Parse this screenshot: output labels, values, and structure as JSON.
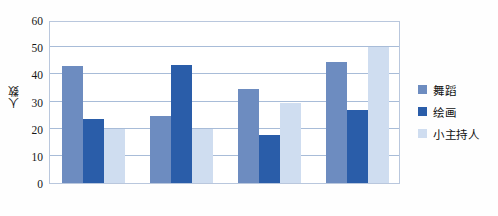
{
  "chart_data": {
    "type": "bar",
    "title": "",
    "xlabel": "",
    "ylabel": "人数",
    "ylim": [
      0,
      60
    ],
    "ytick_values": [
      0,
      10,
      20,
      30,
      40,
      50,
      60
    ],
    "ytick_labels": [
      "0",
      "10",
      "20",
      "30",
      "40",
      "50",
      "60"
    ],
    "grid": "horizontal",
    "legend_position": "right",
    "categories": [
      "",
      "",
      "",
      ""
    ],
    "series": [
      {
        "name": "舞蹈",
        "color": "#6d8cc0",
        "values": [
          43,
          24.5,
          34.5,
          44.5
        ]
      },
      {
        "name": "绘画",
        "color": "#2a5da9",
        "values": [
          23.5,
          43.5,
          17.5,
          27
        ]
      },
      {
        "name": "小主持人",
        "color": "#cfddf0",
        "values": [
          20,
          20,
          29.5,
          50
        ]
      }
    ]
  },
  "axis": {
    "y_title": "人数"
  },
  "legend": {
    "items": [
      {
        "label": "舞蹈",
        "color": "#6d8cc0"
      },
      {
        "label": "绘画",
        "color": "#2a5da9"
      },
      {
        "label": "小主持人",
        "color": "#cfddf0"
      }
    ]
  },
  "style": {
    "plot_background": "#ffffff",
    "grid_color": "#a8bcd8",
    "frame_color": "#b9c7dd",
    "text_color": "#161616"
  }
}
